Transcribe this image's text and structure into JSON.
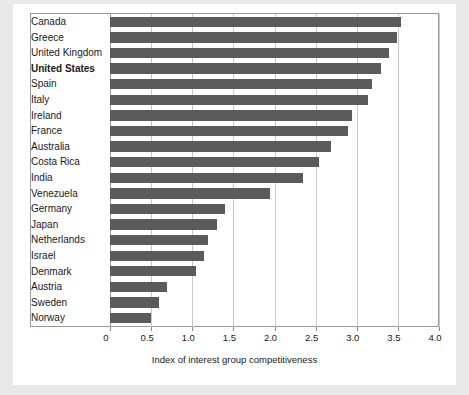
{
  "figure": {
    "background_color": "#ffffff",
    "page_background_color": "#e9e9e9",
    "bar_color": "#5b5b5b",
    "gridline_color": "#c9c9c9"
  },
  "chart_data": {
    "type": "bar",
    "orientation": "horizontal",
    "title": "",
    "xlabel": "Index of interest group competitiveness",
    "ylabel": "",
    "xlim": [
      0,
      4.0
    ],
    "xticks": [
      "0",
      "0.5",
      "1.0",
      "1.5",
      "2.0",
      "2.5",
      "3.0",
      "3.5",
      "4.0"
    ],
    "xtick_values": [
      0,
      0.5,
      1.0,
      1.5,
      2.0,
      2.5,
      3.0,
      3.5,
      4.0
    ],
    "grid": true,
    "legend": "none",
    "highlighted_category": "United States",
    "categories": [
      "Canada",
      "Greece",
      "United Kingdom",
      "United States",
      "Spain",
      "Italy",
      "Ireland",
      "France",
      "Australia",
      "Costa Rica",
      "India",
      "Venezuela",
      "Germany",
      "Japan",
      "Netherlands",
      "Israel",
      "Denmark",
      "Austria",
      "Sweden",
      "Norway"
    ],
    "values": [
      3.55,
      3.5,
      3.4,
      3.3,
      3.2,
      3.15,
      2.95,
      2.9,
      2.7,
      2.55,
      2.35,
      1.95,
      1.4,
      1.3,
      1.2,
      1.15,
      1.05,
      0.7,
      0.6,
      0.5
    ]
  }
}
